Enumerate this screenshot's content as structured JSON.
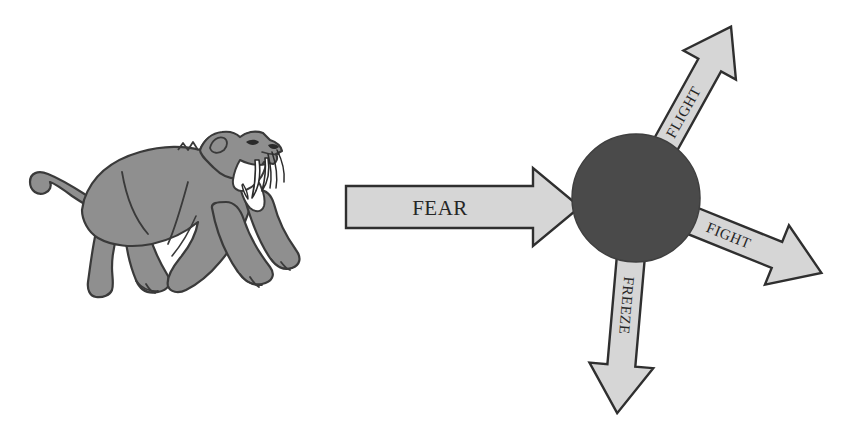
{
  "diagram": {
    "background_color": "#ffffff",
    "stimulus": {
      "name": "saber-toothed-cat",
      "fill_color": "#8f8f8f",
      "outline_color": "#3a3a3a",
      "tooth_color": "#ffffff"
    },
    "hub": {
      "label": "",
      "fill_color": "#4a4a4a",
      "outline_color": "#3a3a3a",
      "center_x": 636,
      "center_y": 198,
      "radius": 64
    },
    "arrow_style": {
      "fill_color": "#d6d6d6",
      "outline_color": "#2f2f2f",
      "text_color": "#262626"
    },
    "arrows": [
      {
        "id": "fear",
        "label": "FEAR",
        "direction": "right",
        "angle_deg": 0,
        "role": "input-stimulus"
      },
      {
        "id": "flight",
        "label": "FLIGHT",
        "direction": "up-right",
        "angle_deg": -61,
        "role": "output-response"
      },
      {
        "id": "fight",
        "label": "FIGHT",
        "direction": "down-right",
        "angle_deg": 22,
        "role": "output-response"
      },
      {
        "id": "freeze",
        "label": "FREEZE",
        "direction": "down",
        "angle_deg": 95,
        "role": "output-response"
      }
    ]
  }
}
